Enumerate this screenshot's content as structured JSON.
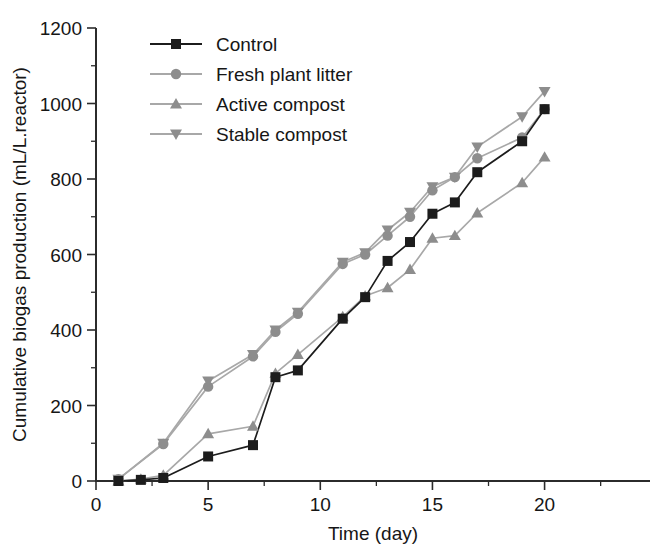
{
  "chart_data": {
    "type": "line",
    "title": "",
    "xlabel": "Time (day)",
    "ylabel": "Cumulative biogas production (mL/L.reactor)",
    "xlim": [
      0,
      24.7
    ],
    "ylim": [
      0,
      1200
    ],
    "xticks": [
      0,
      5,
      10,
      15,
      20
    ],
    "yticks": [
      0,
      200,
      400,
      600,
      800,
      1000,
      1200
    ],
    "xtick_labels": [
      "0",
      "5",
      "10",
      "15",
      "20"
    ],
    "ytick_labels": [
      "0",
      "200",
      "400",
      "600",
      "800",
      "1000",
      "1200"
    ],
    "minor_ticks": true,
    "grid": false,
    "legend_position": "top-left-inside",
    "series": [
      {
        "name": "Control",
        "marker": "square",
        "color": "#1c1c1c",
        "line_color": "#1c1c1c",
        "x": [
          1,
          2,
          3,
          5,
          7,
          8,
          9,
          11,
          12,
          13,
          14,
          15,
          16,
          17,
          19,
          20
        ],
        "y": [
          0,
          3,
          8,
          65,
          95,
          275,
          293,
          430,
          487,
          583,
          633,
          708,
          738,
          818,
          900,
          985
        ]
      },
      {
        "name": "Fresh plant litter",
        "marker": "circle",
        "color": "#8d8d8d",
        "line_color": "#a8a8a8",
        "x": [
          1,
          3,
          5,
          7,
          8,
          9,
          11,
          12,
          13,
          14,
          15,
          16,
          17,
          19,
          20
        ],
        "y": [
          5,
          98,
          250,
          330,
          395,
          443,
          575,
          600,
          650,
          700,
          770,
          805,
          855,
          910,
          985
        ]
      },
      {
        "name": "Active compost",
        "marker": "triangle-up",
        "color": "#8d8d8d",
        "line_color": "#a8a8a8",
        "x": [
          1,
          2,
          3,
          5,
          7,
          8,
          9,
          11,
          12,
          13,
          14,
          15,
          16,
          17,
          19,
          20
        ],
        "y": [
          0,
          5,
          15,
          125,
          145,
          285,
          335,
          435,
          490,
          512,
          560,
          643,
          650,
          710,
          790,
          858
        ]
      },
      {
        "name": "Stable compost",
        "marker": "triangle-down",
        "color": "#8d8d8d",
        "line_color": "#a8a8a8",
        "x": [
          1,
          3,
          5,
          7,
          8,
          9,
          11,
          12,
          13,
          14,
          15,
          16,
          17,
          19,
          20
        ],
        "y": [
          5,
          100,
          265,
          335,
          400,
          447,
          580,
          605,
          665,
          712,
          780,
          805,
          885,
          965,
          1032
        ]
      }
    ]
  },
  "legend": {
    "entries": [
      {
        "label": "Control"
      },
      {
        "label": "Fresh plant litter"
      },
      {
        "label": "Active compost"
      },
      {
        "label": "Stable compost"
      }
    ]
  }
}
